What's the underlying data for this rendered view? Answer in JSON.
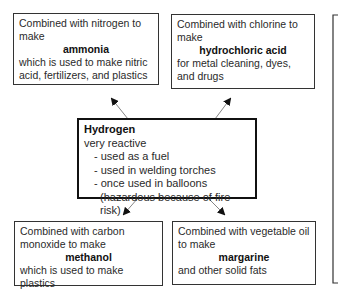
{
  "diagram": {
    "center": {
      "title": "Hydrogen",
      "subtitle": "very reactive",
      "items": [
        "- used as a fuel",
        "- used in welding torches",
        "- once used in balloons",
        "(hazardous because of fire risk)"
      ]
    },
    "top_left": {
      "intro": "Combined with nitrogen to make",
      "product": "ammonia",
      "use": "which is used to make nitric acid, fertilizers, and plastics"
    },
    "top_right": {
      "intro": "Combined with chlorine to make",
      "product": "hydrochloric acid",
      "use": "for metal cleaning, dyes, and drugs"
    },
    "bottom_left": {
      "intro": "Combined with carbon monoxide to make",
      "product": "methanol",
      "use": "which is used to make plastics"
    },
    "bottom_right": {
      "intro": "Combined with vegetable oil to make",
      "product": "margarine",
      "use": "and other solid fats"
    },
    "colors": {
      "border": "#333333",
      "main_border": "#111111",
      "text": "#2a2a2a",
      "background": "#ffffff"
    }
  }
}
